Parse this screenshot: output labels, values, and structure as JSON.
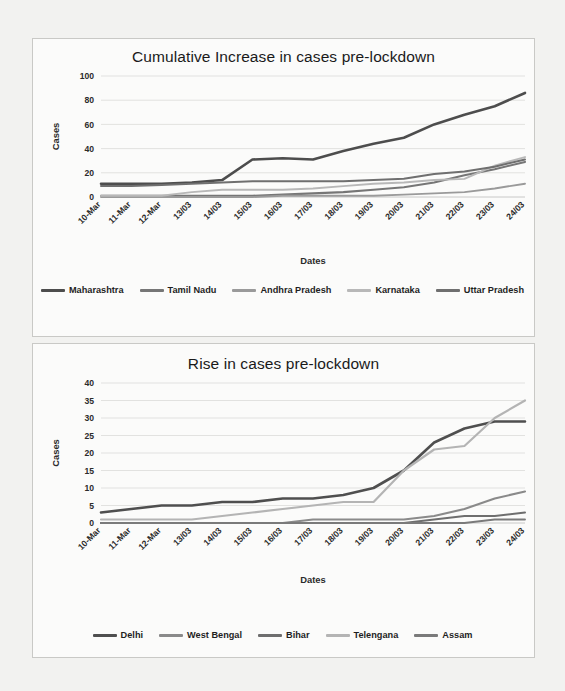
{
  "figure": {
    "background_color": "#f2f2f0",
    "panel_color": "#fbfbfa",
    "border_color": "#c9c9c6"
  },
  "chart_data": [
    {
      "id": "cumulative-increase-pre-lockdown",
      "type": "line",
      "title": "Cumulative Increase in cases pre-lockdown",
      "xlabel": "Dates",
      "ylabel": "Cases",
      "grid": true,
      "legend_position": "bottom",
      "ylim": [
        0,
        100
      ],
      "yticks": [
        0,
        20,
        40,
        60,
        80,
        100
      ],
      "categories": [
        "10-Mar",
        "11-Mar",
        "12-Mar",
        "13/03",
        "14/03",
        "15/03",
        "16/03",
        "17/03",
        "18/03",
        "19/03",
        "20/03",
        "21/03",
        "22/03",
        "23/03",
        "24/03"
      ],
      "series": [
        {
          "name": "Maharashtra",
          "color": "#4d4d4d",
          "width": 2.6,
          "values": [
            11,
            11,
            11,
            12,
            14,
            31,
            32,
            31,
            38,
            44,
            49,
            60,
            68,
            75,
            86
          ]
        },
        {
          "name": "Tamil Nadu",
          "color": "#767676",
          "width": 2.1,
          "values": [
            1,
            1,
            1,
            1,
            1,
            1,
            2,
            3,
            4,
            6,
            8,
            12,
            18,
            23,
            29
          ]
        },
        {
          "name": "Andhra Pradesh",
          "color": "#9a9a9a",
          "width": 1.9,
          "values": [
            0,
            0,
            0,
            0,
            0,
            0,
            1,
            1,
            1,
            1,
            2,
            3,
            4,
            7,
            11
          ]
        },
        {
          "name": "Karnataka",
          "color": "#b8b8b8",
          "width": 1.9,
          "values": [
            1,
            1,
            1,
            4,
            6,
            6,
            6,
            7,
            9,
            11,
            12,
            14,
            15,
            26,
            33
          ]
        },
        {
          "name": "Uttar Pradesh",
          "color": "#6f6f6f",
          "width": 2.0,
          "values": [
            9,
            9,
            10,
            11,
            12,
            13,
            13,
            13,
            13,
            14,
            15,
            19,
            21,
            25,
            31
          ]
        }
      ]
    },
    {
      "id": "rise-in-cases-pre-lockdown",
      "type": "line",
      "title": "Rise in cases pre-lockdown",
      "xlabel": "Dates",
      "ylabel": "Cases",
      "grid": true,
      "legend_position": "bottom",
      "ylim": [
        0,
        40
      ],
      "yticks": [
        0,
        5,
        10,
        15,
        20,
        25,
        30,
        35,
        40
      ],
      "categories": [
        "10-Mar",
        "11-Mar",
        "12-Mar",
        "13/03",
        "14/03",
        "15/03",
        "16/03",
        "17/03",
        "18/03",
        "19/03",
        "20/03",
        "21/03",
        "22/03",
        "23/03",
        "24/03"
      ],
      "series": [
        {
          "name": "Delhi",
          "color": "#4f4f4f",
          "width": 2.6,
          "values": [
            3,
            4,
            5,
            5,
            6,
            6,
            7,
            7,
            8,
            10,
            15,
            23,
            27,
            29,
            29
          ]
        },
        {
          "name": "West Bengal",
          "color": "#8a8a8a",
          "width": 2.1,
          "values": [
            0,
            0,
            0,
            0,
            0,
            0,
            0,
            1,
            1,
            1,
            1,
            2,
            4,
            7,
            9
          ]
        },
        {
          "name": "Bihar",
          "color": "#6e6e6e",
          "width": 2.0,
          "values": [
            0,
            0,
            0,
            0,
            0,
            0,
            0,
            0,
            0,
            0,
            0,
            1,
            2,
            2,
            3
          ]
        },
        {
          "name": "Telengana",
          "color": "#b4b4b4",
          "width": 2.2,
          "values": [
            1,
            1,
            1,
            1,
            2,
            3,
            4,
            5,
            6,
            6,
            15,
            21,
            22,
            30,
            35
          ]
        },
        {
          "name": "Assam",
          "color": "#7a7a7a",
          "width": 1.9,
          "values": [
            0,
            0,
            0,
            0,
            0,
            0,
            0,
            0,
            0,
            0,
            0,
            0,
            0,
            1,
            1
          ]
        }
      ]
    }
  ]
}
